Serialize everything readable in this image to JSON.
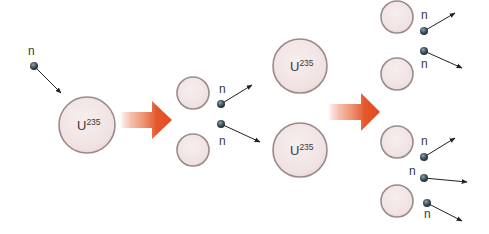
{
  "colors": {
    "nucleus_fill": "#f3e6e6",
    "nucleus_stroke": "#9a8b8b",
    "neutron_fill": "#3f5563",
    "arrow_color": "#e4502a",
    "line_color": "#222222"
  },
  "labels": {
    "neutron": "n",
    "uranium_base": "U",
    "uranium_mass": "235"
  },
  "stage1": {
    "incoming_neutron": {
      "label": "n",
      "cx": 34,
      "cy": 66,
      "tip": [
        61,
        93
      ],
      "label_pos": [
        28,
        55
      ]
    },
    "nucleus": {
      "cx": 87,
      "cy": 125,
      "r": 28,
      "element": "U",
      "mass": "235"
    }
  },
  "arrows": [
    {
      "x0": 120,
      "x1": 172,
      "cy": 120,
      "shaft_half": 8,
      "head_start": 152,
      "head_half": 19
    },
    {
      "x0": 328,
      "x1": 380,
      "cy": 112,
      "shaft_half": 8,
      "head_start": 361,
      "head_half": 19
    }
  ],
  "stage2": {
    "fragments": [
      {
        "cx": 193,
        "cy": 93,
        "r": 16
      },
      {
        "cx": 193,
        "cy": 150,
        "r": 16
      }
    ],
    "neutrons": [
      {
        "label": "n",
        "cx": 221,
        "cy": 104,
        "tip": [
          252,
          85
        ],
        "label_pos": [
          219,
          93
        ]
      },
      {
        "label": "n",
        "cx": 221,
        "cy": 124,
        "tip": [
          260,
          142
        ],
        "label_pos": [
          219,
          145
        ]
      }
    ]
  },
  "stage3": {
    "nuclei": [
      {
        "cx": 300,
        "cy": 66,
        "r": 27,
        "element": "U",
        "mass": "235"
      },
      {
        "cx": 300,
        "cy": 150,
        "r": 27,
        "element": "U",
        "mass": "235"
      }
    ]
  },
  "stage4": {
    "fragments": [
      {
        "cx": 397,
        "cy": 17,
        "r": 16
      },
      {
        "cx": 397,
        "cy": 74,
        "r": 16
      },
      {
        "cx": 397,
        "cy": 142,
        "r": 16
      },
      {
        "cx": 397,
        "cy": 201,
        "r": 16
      }
    ],
    "neutrons": [
      {
        "label": "n",
        "cx": 424,
        "cy": 31,
        "tip": [
          455,
          13
        ],
        "label_pos": [
          421,
          19
        ]
      },
      {
        "label": "n",
        "cx": 424,
        "cy": 51,
        "tip": [
          462,
          68
        ],
        "label_pos": [
          421,
          68
        ]
      },
      {
        "label": "n",
        "cx": 424,
        "cy": 157,
        "tip": [
          455,
          138
        ],
        "label_pos": [
          421,
          145
        ]
      },
      {
        "label": "n",
        "cx": 424,
        "cy": 178,
        "tip": [
          467,
          182
        ],
        "label_pos": [
          409,
          175
        ]
      },
      {
        "label": "n",
        "cx": 427,
        "cy": 203,
        "tip": [
          462,
          221
        ],
        "label_pos": [
          424,
          218
        ]
      }
    ]
  }
}
